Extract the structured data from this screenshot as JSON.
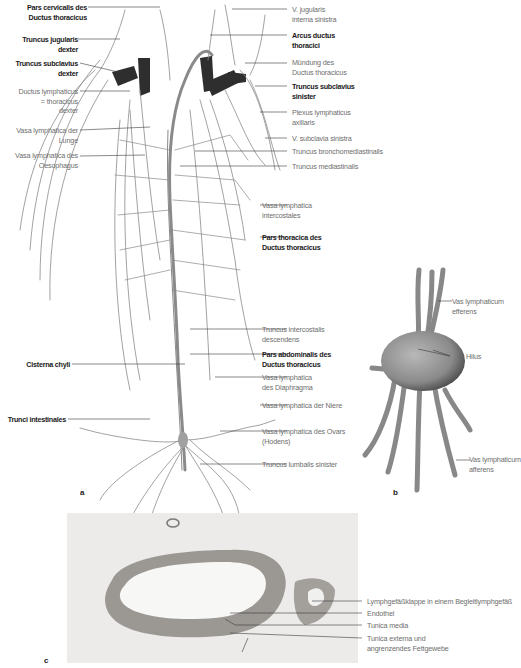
{
  "panel_a": {
    "letter": "a",
    "left_labels": [
      {
        "lines": [
          "Pars cervicalis des",
          "Ductus thoracicus"
        ],
        "bold": true
      },
      {
        "lines": [
          "Truncus jugularis",
          "dexter"
        ],
        "bold": true
      },
      {
        "lines": [
          "Truncus subclavius",
          "dexter"
        ],
        "bold": true
      },
      {
        "lines": [
          "Ductus lymphaticus",
          "= thoracicus",
          "dexter"
        ],
        "bold": false
      },
      {
        "lines": [
          "Vasa lymphatica der",
          "Lunge"
        ],
        "bold": false
      },
      {
        "lines": [
          "Vasa lymphatica des",
          "Oesophagus"
        ],
        "bold": false
      },
      {
        "lines": [
          "Cisterna chyli"
        ],
        "bold": true
      },
      {
        "lines": [
          "Trunci intestinales"
        ],
        "bold": true
      }
    ],
    "right_labels": [
      {
        "lines": [
          "V. jugularis",
          "interna sinistra"
        ],
        "bold": false
      },
      {
        "lines": [
          "Arcus ductus",
          "thoracici"
        ],
        "bold": true
      },
      {
        "lines": [
          "Mündung des",
          "Ductus thoracicus"
        ],
        "bold": false
      },
      {
        "lines": [
          "Truncus subclavius",
          "sinister"
        ],
        "bold": true
      },
      {
        "lines": [
          "Plexus lymphaticus",
          "axillaris"
        ],
        "bold": false
      },
      {
        "lines": [
          "V. subclavia sinistra"
        ],
        "bold": false
      },
      {
        "lines": [
          "Truncus bronchomediastinalis"
        ],
        "bold": false
      },
      {
        "lines": [
          "Truncus mediastinalis"
        ],
        "bold": false
      },
      {
        "lines": [
          "Vasa lymphatica",
          "intercostales"
        ],
        "bold": false
      },
      {
        "lines": [
          "Pars thoracica des",
          "Ductus thoracicus"
        ],
        "bold": true
      },
      {
        "lines": [
          "Truncus intercostalis",
          "descendens"
        ],
        "bold": false
      },
      {
        "lines": [
          "Pars abdominalis des",
          "Ductus thoracicus"
        ],
        "bold": true
      },
      {
        "lines": [
          "Vasa lymphatica",
          "des Diaphragma"
        ],
        "bold": false
      },
      {
        "lines": [
          "Vasa lymphatica der Niere"
        ],
        "bold": false
      },
      {
        "lines": [
          "Vasa lymphatica des Ovars",
          "(Hodens)"
        ],
        "bold": false
      },
      {
        "lines": [
          "Truncus lumbalis sinister"
        ],
        "bold": false
      }
    ]
  },
  "panel_b": {
    "letter": "b",
    "labels": [
      {
        "lines": [
          "Vas lymphaticum",
          "efferens"
        ]
      },
      {
        "lines": [
          "Hilus"
        ]
      },
      {
        "lines": [
          "Vas lymphaticum",
          "afferens"
        ]
      }
    ]
  },
  "panel_c": {
    "letter": "c",
    "labels": [
      {
        "lines": [
          "Lymphgefäßklappe in einem Begleitlymphgefäß"
        ]
      },
      {
        "lines": [
          "Endothel"
        ]
      },
      {
        "lines": [
          "Tunica media"
        ]
      },
      {
        "lines": [
          "Tunica externa und",
          "angrenzendes Fettgewebe"
        ]
      }
    ]
  },
  "colors": {
    "vessel": "#8a8a8a",
    "vein_dark": "#2e2e2e",
    "node": "#9a9a9a",
    "histology_bg": "#ecebea",
    "histology_wall": "#9b9894"
  }
}
